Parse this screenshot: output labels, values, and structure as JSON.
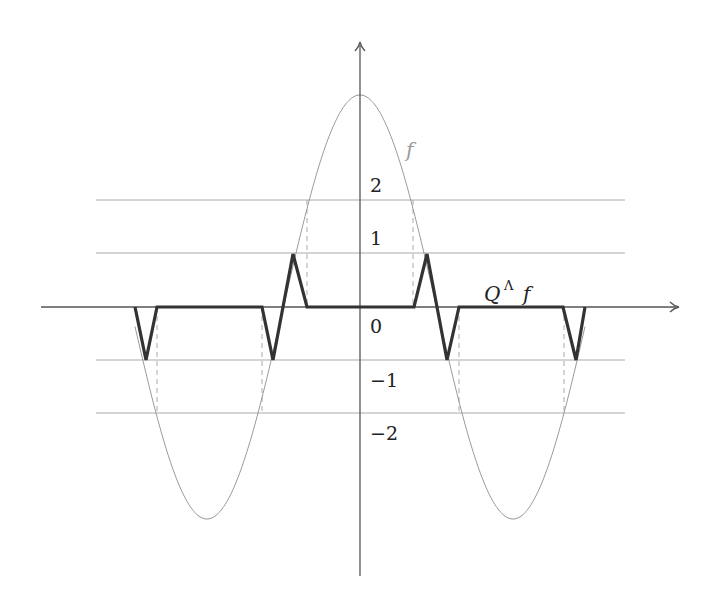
{
  "diagram": {
    "function_label": "f",
    "quantized_label_Q": "Q",
    "quantized_label_sup": "Λ",
    "quantized_label_f": "f",
    "y_tick_labels": [
      "2",
      "1",
      "0",
      "−1",
      "−2"
    ],
    "colors": {
      "axis": "#555555",
      "grid": "#aaaaaa",
      "curve": "#999999",
      "quantized": "#333333",
      "dashed": "#aaaaaa"
    }
  },
  "chart_data": {
    "type": "line",
    "title": "",
    "xlabel": "",
    "ylabel": "",
    "grid_levels": [
      2,
      1,
      -1,
      -2
    ],
    "series": [
      {
        "name": "f",
        "description": "cosine, amplitude 4, peak at x=0",
        "amplitude": 4
      },
      {
        "name": "Q^Λ f",
        "description": "quantized f: zero except triangular spikes of height ±1 near level crossings"
      }
    ]
  }
}
